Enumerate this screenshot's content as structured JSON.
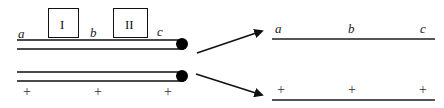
{
  "figure": {
    "background_color": "#ffffff",
    "line_color": "#4a4a4a",
    "stroke_color": "#111111",
    "dot_color": "#000000"
  },
  "left_panel": {
    "boxes": [
      {
        "label": "I",
        "x": 48,
        "y": 8,
        "w": 31,
        "h": 30
      },
      {
        "label": "II",
        "x": 113,
        "y": 8,
        "w": 35,
        "h": 30
      }
    ],
    "top_labels": [
      {
        "text": "a",
        "x": 18,
        "y": 27
      },
      {
        "text": "b",
        "x": 90,
        "y": 27
      },
      {
        "text": "c",
        "x": 157,
        "y": 25
      }
    ],
    "top_rod": {
      "x1": 17,
      "x2": 182,
      "y_upper": 40,
      "y_lower": 48,
      "dot": {
        "cx": 182,
        "cy": 44,
        "r": 6
      }
    },
    "bottom_rod": {
      "x1": 17,
      "x2": 182,
      "y_upper": 72,
      "y_lower": 80,
      "dot": {
        "cx": 182,
        "cy": 76,
        "r": 6
      }
    },
    "bottom_marks": [
      {
        "text": "+",
        "x": 23,
        "y": 86
      },
      {
        "text": "+",
        "x": 94,
        "y": 86
      },
      {
        "text": "+",
        "x": 164,
        "y": 86
      }
    ]
  },
  "arrows": [
    {
      "name": "arrow-to-top-result",
      "x1": 197,
      "y1": 53,
      "x2": 264,
      "y2": 31
    },
    {
      "name": "arrow-to-bottom-result",
      "x1": 196,
      "y1": 74,
      "x2": 264,
      "y2": 95
    }
  ],
  "right_panel": {
    "top_result": {
      "labels": [
        {
          "text": "a",
          "x": 275,
          "y": 22
        },
        {
          "text": "b",
          "x": 348,
          "y": 22
        },
        {
          "text": "c",
          "x": 420,
          "y": 22
        }
      ],
      "line": {
        "x1": 272,
        "x2": 435,
        "y": 39
      }
    },
    "bottom_result": {
      "labels": [
        {
          "text": "+",
          "x": 277,
          "y": 84
        },
        {
          "text": "+",
          "x": 348,
          "y": 84
        },
        {
          "text": "+",
          "x": 419,
          "y": 84
        }
      ],
      "line": {
        "x1": 272,
        "x2": 435,
        "y": 100
      }
    }
  }
}
